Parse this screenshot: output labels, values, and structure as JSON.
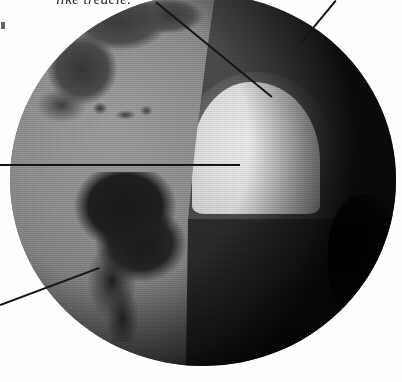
{
  "figure": {
    "caption_fragment": "like treacle."
  },
  "callouts": [
    {
      "id": "callout-mantle-upper",
      "name": "upper-diagonal-leader",
      "from": [
        156,
        1
      ],
      "to": [
        272,
        96
      ],
      "target": "mantle"
    },
    {
      "id": "callout-crust",
      "name": "top-right-leader",
      "from": [
        336,
        0
      ],
      "to": [
        302,
        41
      ],
      "target": "crust"
    },
    {
      "id": "callout-core",
      "name": "horizontal-leader",
      "from": [
        0,
        164
      ],
      "to": [
        240,
        164
      ],
      "target": "inner-core"
    },
    {
      "id": "callout-surface",
      "name": "lower-left-leader",
      "from": [
        0,
        304
      ],
      "to": [
        99,
        267
      ],
      "target": "surface"
    }
  ],
  "globe": {
    "label": "earth-globe",
    "center": [
      203,
      180
    ],
    "radius": 193,
    "layers": [
      {
        "name": "surface",
        "label": "Earth surface with continents",
        "tone": "#8a8a8a"
      },
      {
        "name": "mantle",
        "label": "Mantle (cut face, upper wedge)",
        "tone": "#4d4d4d"
      },
      {
        "name": "outer-core",
        "label": "Outer core (cut face, lower wedge)",
        "tone": "#2f2f2f"
      },
      {
        "name": "inner-core",
        "label": "Inner core (bright dome)",
        "tone": "#ededed"
      }
    ],
    "landmasses": [
      {
        "name": "greenland",
        "label": "Greenland"
      },
      {
        "name": "north-america",
        "label": "North America"
      },
      {
        "name": "caribbean",
        "label": "Caribbean islands"
      },
      {
        "name": "south-america",
        "label": "South America"
      }
    ]
  },
  "colors": {
    "paper": "#ffffff",
    "ink": "#141414",
    "ocean": "#8a8a8a",
    "land": "#232323",
    "mantle": "#4d4d4d",
    "outer_core": "#2f2f2f",
    "inner_core": "#ededed",
    "limb_shadow": "#0c0c0c"
  }
}
